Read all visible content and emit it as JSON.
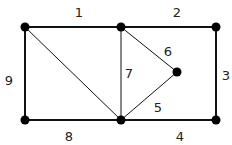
{
  "graph": {
    "nodes": [
      {
        "id": "A",
        "x": 25,
        "y": 27
      },
      {
        "id": "B",
        "x": 121,
        "y": 27
      },
      {
        "id": "C",
        "x": 216,
        "y": 27
      },
      {
        "id": "D",
        "x": 177,
        "y": 72
      },
      {
        "id": "E",
        "x": 25,
        "y": 120
      },
      {
        "id": "F",
        "x": 121,
        "y": 120
      },
      {
        "id": "G",
        "x": 216,
        "y": 120
      }
    ],
    "edges": [
      {
        "label": "1",
        "from": "A",
        "to": "B",
        "lx": 79,
        "ly": 17
      },
      {
        "label": "2",
        "from": "B",
        "to": "C",
        "lx": 177,
        "ly": 17
      },
      {
        "label": "3",
        "from": "C",
        "to": "G",
        "lx": 226,
        "ly": 80
      },
      {
        "label": "4",
        "from": "F",
        "to": "G",
        "lx": 180,
        "ly": 141
      },
      {
        "label": "5",
        "from": "F",
        "to": "D",
        "lx": 158,
        "ly": 112
      },
      {
        "label": "6",
        "from": "B",
        "to": "D",
        "lx": 168,
        "ly": 56
      },
      {
        "label": "7",
        "from": "B",
        "to": "F",
        "lx": 129,
        "ly": 78
      },
      {
        "label": "8",
        "from": "E",
        "to": "F",
        "lx": 69,
        "ly": 141
      },
      {
        "label": "9",
        "from": "A",
        "to": "E",
        "lx": 9,
        "ly": 85
      },
      {
        "label": "",
        "from": "A",
        "to": "F",
        "lx": 0,
        "ly": 0
      }
    ]
  }
}
